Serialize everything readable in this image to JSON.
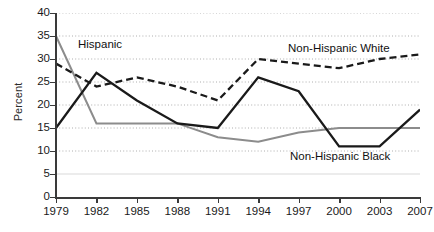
{
  "chart_data": {
    "type": "line",
    "title": "",
    "xlabel": "",
    "ylabel": "Percent",
    "categories": [
      "1979",
      "1982",
      "1985",
      "1988",
      "1991",
      "1994",
      "1997",
      "2000",
      "2003",
      "2007"
    ],
    "x": [
      1979,
      1982,
      1985,
      1988,
      1991,
      1994,
      1997,
      2000,
      2003,
      2007
    ],
    "ylim": [
      0,
      40
    ],
    "yticks": [
      "0",
      "5",
      "10",
      "15",
      "20",
      "25",
      "30",
      "35",
      "40"
    ],
    "grid": true,
    "legend_position": "inline-annotations",
    "series": [
      {
        "name": "Hispanic",
        "style": "solid-gray",
        "color": "#8c8c8c",
        "values": [
          35,
          16,
          16,
          16,
          13,
          12,
          14,
          15,
          15,
          15
        ]
      },
      {
        "name": "Non-Hispanic White",
        "style": "dashed-black",
        "color": "#1a1a1a",
        "values": [
          29,
          24,
          26,
          24,
          21,
          30,
          29,
          28,
          30,
          31
        ]
      },
      {
        "name": "Non-Hispanic Black",
        "style": "solid-black",
        "color": "#1a1a1a",
        "values": [
          15,
          27,
          21,
          16,
          15,
          26,
          23,
          11,
          11,
          19
        ]
      }
    ],
    "annotations": [
      {
        "text": "Hispanic",
        "x": 78,
        "y": 38
      },
      {
        "text": "Non-Hispanic White",
        "x": 288,
        "y": 42
      },
      {
        "text": "Non-Hispanic Black",
        "x": 290,
        "y": 150
      }
    ]
  }
}
